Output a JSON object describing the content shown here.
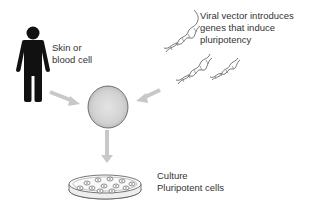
{
  "diagram": {
    "nodes": [
      {
        "id": "person",
        "label": "Skin or\nblood cell",
        "icon": "person-icon"
      },
      {
        "id": "viral-vector",
        "label": "Viral vector introduces\ngenes that induce\npluripotency",
        "icon": "dna-helix-icon"
      },
      {
        "id": "cell",
        "label": "",
        "icon": "cell-sphere-icon"
      },
      {
        "id": "culture",
        "label": "Culture\nPluripotent cells",
        "icon": "petri-dish-icon"
      }
    ],
    "edges": [
      {
        "from": "person",
        "to": "cell"
      },
      {
        "from": "viral-vector",
        "to": "cell"
      },
      {
        "from": "cell",
        "to": "culture"
      }
    ]
  },
  "labels": {
    "person": "Skin or\nblood cell",
    "viral": "Viral vector introduces\ngenes that induce\npluripotency",
    "culture": "Culture\nPluripotent cells"
  },
  "colors": {
    "arrow": "#c8c8c8",
    "person": "#111111",
    "text": "#333333",
    "cell_fill": "#d8d8d8",
    "cell_stroke": "#555555"
  }
}
